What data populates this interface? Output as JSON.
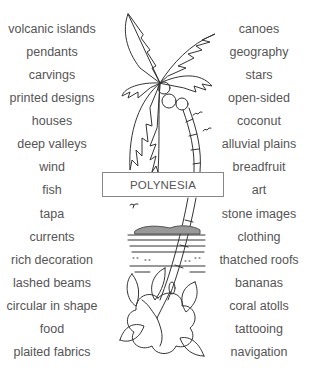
{
  "title_label": "POLYNESIA",
  "left_words": [
    "volcanic islands",
    "pendants",
    "carvings",
    "printed designs",
    "houses",
    "deep valleys",
    "wind",
    "fish",
    "tapa",
    "currents",
    "rich decoration",
    "lashed beams",
    "circular in shape",
    "food",
    "plaited fabrics"
  ],
  "right_words": [
    "canoes",
    "geography",
    "stars",
    "open-sided",
    "coconut",
    "alluvial plains",
    "breadfruit",
    "art",
    "stone images",
    "clothing",
    "thatched roofs",
    "bananas",
    "coral atolls",
    "tattooing",
    "navigation"
  ],
  "illustration": {
    "elements": [
      "palm-tree",
      "coconuts",
      "birds",
      "island-horizon",
      "waves",
      "hibiscus-flower"
    ]
  },
  "colors": {
    "text": "#555555",
    "line": "#333333",
    "box_border": "#888888"
  }
}
